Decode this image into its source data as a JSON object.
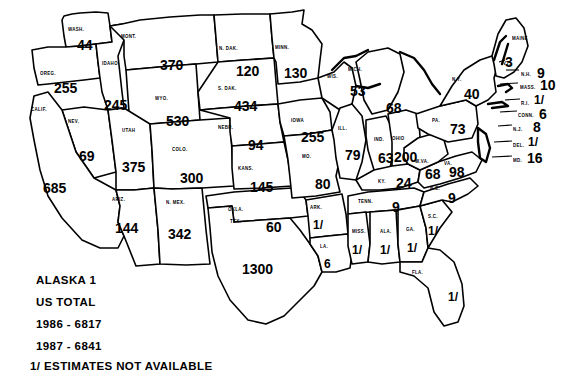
{
  "map": {
    "title": "U.S. state map with numeric values by state",
    "ink_color": "#000000",
    "background_color": "#ffffff"
  },
  "legend": {
    "alaska_line": "ALASKA  1",
    "us_total_label": "US TOTAL",
    "year_1986": "1986 - 6817",
    "year_1987": "1987 - 6841",
    "footnote": "1/ ESTIMATES NOT AVAILABLE"
  },
  "chart_data": {
    "type": "map",
    "title": "US TOTAL",
    "annotations": [
      "ALASKA  1",
      "US TOTAL",
      "1986 - 6817",
      "1987 - 6841",
      "1/ ESTIMATES NOT AVAILABLE"
    ],
    "totals": {
      "1986": 6817,
      "1987": 6841,
      "alaska": 1
    },
    "missing_marker": "1/",
    "categories": [
      "WASH.",
      "OREG.",
      "IDAHO",
      "MONT.",
      "WYO.",
      "NEV.",
      "UTAH",
      "CALIF.",
      "ARIZ.",
      "COLO.",
      "N. MEX.",
      "N. DAK.",
      "S. DAK.",
      "NEBR.",
      "KANS.",
      "OKLA.",
      "TEX.",
      "MINN.",
      "IOWA",
      "MO.",
      "ARK.",
      "LA.",
      "WIS.",
      "ILL.",
      "MICH.",
      "IND.",
      "OHIO",
      "KY.",
      "TENN.",
      "MISS.",
      "ALA.",
      "GA.",
      "FLA.",
      "S.C.",
      "N.C.",
      "VA.",
      "W.VA.",
      "MD.",
      "DEL.",
      "PA.",
      "N.J.",
      "N.Y.",
      "CONN.",
      "R.I.",
      "MASS.",
      "VT.",
      "N.H.",
      "MAINE"
    ],
    "values": [
      44,
      255,
      245,
      370,
      530,
      69,
      375,
      685,
      144,
      300,
      342,
      120,
      434,
      94,
      145,
      60,
      1300,
      130,
      255,
      80,
      null,
      6,
      53,
      79,
      68,
      63,
      200,
      24,
      9,
      null,
      null,
      null,
      null,
      null,
      9,
      98,
      68,
      16,
      null,
      73,
      8,
      40,
      6,
      null,
      10,
      null,
      9,
      3
    ]
  },
  "states": [
    {
      "abbr": "WASH.",
      "value": "44",
      "ax": 68,
      "ay": 26,
      "vx": 77,
      "vy": 37,
      "size": "val"
    },
    {
      "abbr": "OREG.",
      "value": "255",
      "ax": 40,
      "ay": 70,
      "vx": 54,
      "vy": 80,
      "size": "val"
    },
    {
      "abbr": "IDAHO",
      "value": "245",
      "ax": 102,
      "ay": 60,
      "vx": 104,
      "vy": 97,
      "size": "val"
    },
    {
      "abbr": "MONT.",
      "value": "370",
      "ax": 121,
      "ay": 33,
      "vx": 160,
      "vy": 57,
      "size": "val"
    },
    {
      "abbr": "WYO.",
      "value": "530",
      "ax": 155,
      "ay": 95,
      "vx": 166,
      "vy": 113,
      "size": "val"
    },
    {
      "abbr": "NEV.",
      "value": "69",
      "ax": 68,
      "ay": 118,
      "vx": 79,
      "vy": 148,
      "size": "val"
    },
    {
      "abbr": "UTAH",
      "value": "375",
      "ax": 122,
      "ay": 127,
      "vx": 122,
      "vy": 159,
      "size": "val"
    },
    {
      "abbr": "CALIF.",
      "value": "685",
      "ax": 31,
      "ay": 106,
      "vx": 43,
      "vy": 180,
      "size": "val"
    },
    {
      "abbr": "ARIZ.",
      "value": "144",
      "ax": 112,
      "ay": 196,
      "vx": 115,
      "vy": 220,
      "size": "val"
    },
    {
      "abbr": "COLO.",
      "value": "300",
      "ax": 172,
      "ay": 146,
      "vx": 180,
      "vy": 170,
      "size": "val"
    },
    {
      "abbr": "N. MEX.",
      "value": "342",
      "ax": 166,
      "ay": 199,
      "vx": 168,
      "vy": 226,
      "size": "val"
    },
    {
      "abbr": "N. DAK.",
      "value": "120",
      "ax": 219,
      "ay": 45,
      "vx": 236,
      "vy": 63,
      "size": "val"
    },
    {
      "abbr": "S. DAK.",
      "value": "434",
      "ax": 218,
      "ay": 85,
      "vx": 234,
      "vy": 98,
      "size": "val"
    },
    {
      "abbr": "NEBR.",
      "value": "94",
      "ax": 218,
      "ay": 124,
      "vx": 248,
      "vy": 137,
      "size": "val"
    },
    {
      "abbr": "KANS.",
      "value": "145",
      "ax": 238,
      "ay": 165,
      "vx": 250,
      "vy": 179,
      "size": "val"
    },
    {
      "abbr": "OKLA.",
      "value": "60",
      "ax": 228,
      "ay": 206,
      "vx": 266,
      "vy": 219,
      "size": "val"
    },
    {
      "abbr": "TEX.",
      "value": "1300",
      "ax": 230,
      "ay": 218,
      "vx": 242,
      "vy": 261,
      "size": "val"
    },
    {
      "abbr": "MINN.",
      "value": "130",
      "ax": 275,
      "ay": 44,
      "vx": 284,
      "vy": 65,
      "size": "val"
    },
    {
      "abbr": "IOWA",
      "value": "255",
      "ax": 291,
      "ay": 117,
      "vx": 301,
      "vy": 129,
      "size": "val"
    },
    {
      "abbr": "MO.",
      "value": "80",
      "ax": 302,
      "ay": 153,
      "vx": 315,
      "vy": 176,
      "size": "val"
    },
    {
      "abbr": "ARK.",
      "value": "1/",
      "ax": 310,
      "ay": 204,
      "vx": 313,
      "vy": 218,
      "size": "val-sm"
    },
    {
      "abbr": "LA.",
      "value": "6",
      "ax": 320,
      "ay": 243,
      "vx": 324,
      "vy": 257,
      "size": "val-sm"
    },
    {
      "abbr": "WIS.",
      "value": "53",
      "ax": 327,
      "ay": 73,
      "vx": 350,
      "vy": 83,
      "size": "val"
    },
    {
      "abbr": "ILL.",
      "value": "79",
      "ax": 338,
      "ay": 125,
      "vx": 345,
      "vy": 147,
      "size": "val"
    },
    {
      "abbr": "MICH.",
      "value": "68",
      "ax": 348,
      "ay": 66,
      "vx": 386,
      "vy": 100,
      "size": "val"
    },
    {
      "abbr": "IND.",
      "value": "63",
      "ax": 374,
      "ay": 136,
      "vx": 378,
      "vy": 150,
      "size": "val"
    },
    {
      "abbr": "OHIO",
      "value": "200",
      "ax": 392,
      "ay": 135,
      "vx": 394,
      "vy": 149,
      "size": "val"
    },
    {
      "abbr": "KY.",
      "value": "24",
      "ax": 378,
      "ay": 178,
      "vx": 396,
      "vy": 175,
      "size": "val"
    },
    {
      "abbr": "TENN.",
      "value": "9",
      "ax": 358,
      "ay": 198,
      "vx": 392,
      "vy": 199,
      "size": "val"
    },
    {
      "abbr": "MISS.",
      "value": "1/",
      "ax": 352,
      "ay": 228,
      "vx": 352,
      "vy": 243,
      "size": "val-sm"
    },
    {
      "abbr": "ALA.",
      "value": "1/",
      "ax": 380,
      "ay": 228,
      "vx": 380,
      "vy": 243,
      "size": "val-sm"
    },
    {
      "abbr": "GA.",
      "value": "1/",
      "ax": 406,
      "ay": 226,
      "vx": 407,
      "vy": 241,
      "size": "val-sm"
    },
    {
      "abbr": "FLA.",
      "value": "1/",
      "ax": 412,
      "ay": 269,
      "vx": 448,
      "vy": 290,
      "size": "val-sm"
    },
    {
      "abbr": "S.C.",
      "value": "1/",
      "ax": 428,
      "ay": 213,
      "vx": 428,
      "vy": 224,
      "size": "val-sm"
    },
    {
      "abbr": "N.C.",
      "value": "9",
      "ax": 430,
      "ay": 185,
      "vx": 448,
      "vy": 190,
      "size": "val"
    },
    {
      "abbr": "VA.",
      "value": "98",
      "ax": 444,
      "ay": 160,
      "vx": 449,
      "vy": 164,
      "size": "val"
    },
    {
      "abbr": "W.VA.",
      "value": "68",
      "ax": 415,
      "ay": 158,
      "vx": 425,
      "vy": 166,
      "size": "val"
    },
    {
      "abbr": "PA.",
      "value": "73",
      "ax": 432,
      "ay": 117,
      "vx": 450,
      "vy": 121,
      "size": "val"
    },
    {
      "abbr": "N.Y.",
      "value": "40",
      "ax": 452,
      "ay": 76,
      "vx": 464,
      "vy": 86,
      "size": "val"
    },
    {
      "abbr": "MAINE",
      "value": "3",
      "ax": 512,
      "ay": 35,
      "vx": 505,
      "vy": 54,
      "size": "val"
    }
  ],
  "callouts": [
    {
      "abbr": "N.H.",
      "value": "9",
      "lx": 521,
      "ly": 71,
      "vx": 537,
      "vy": 65,
      "size": "val"
    },
    {
      "abbr": "MASS.",
      "value": "10",
      "lx": 520,
      "ly": 84,
      "vx": 540,
      "vy": 77,
      "size": "val"
    },
    {
      "abbr": "R.I.",
      "value": "1/",
      "lx": 521,
      "ly": 100,
      "vx": 534,
      "vy": 93,
      "size": "val-sm"
    },
    {
      "abbr": "CONN.",
      "value": "6",
      "lx": 518,
      "ly": 112,
      "vx": 539,
      "vy": 106,
      "size": "val"
    },
    {
      "abbr": "N.J.",
      "value": "8",
      "lx": 513,
      "ly": 126,
      "vx": 533,
      "vy": 119,
      "size": "val"
    },
    {
      "abbr": "DEL.",
      "value": "1/",
      "lx": 513,
      "ly": 142,
      "vx": 528,
      "vy": 135,
      "size": "val-sm"
    },
    {
      "abbr": "MD.",
      "value": "16",
      "lx": 513,
      "ly": 157,
      "vx": 527,
      "vy": 150,
      "size": "val"
    },
    {
      "abbr": "VT.",
      "value": "",
      "lx": 503,
      "ly": 60,
      "vx": 0,
      "vy": 0,
      "size": "val"
    }
  ]
}
